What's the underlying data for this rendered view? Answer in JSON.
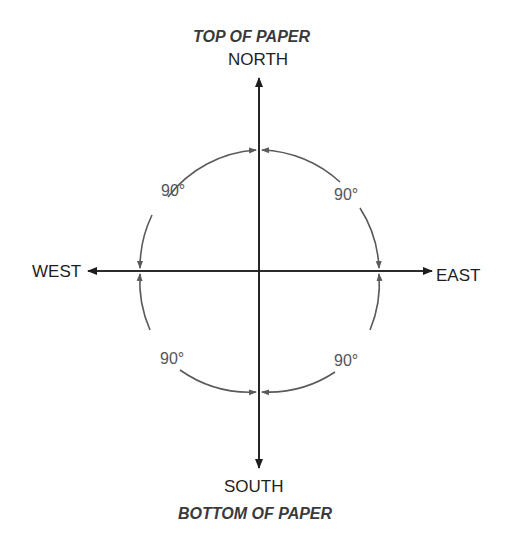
{
  "labels": {
    "top_of_paper": "TOP OF PAPER",
    "north": "NORTH",
    "south": "SOUTH",
    "bottom_of_paper": "BOTTOM OF PAPER",
    "west": "WEST",
    "east": "EAST"
  },
  "angles": {
    "upper_left": "90°",
    "upper_right": "90°",
    "lower_left": "90°",
    "lower_right": "90°"
  },
  "colors": {
    "axis": "#1e1e1e",
    "arc": "#5a5a5a",
    "text": "#1e1e1e"
  }
}
